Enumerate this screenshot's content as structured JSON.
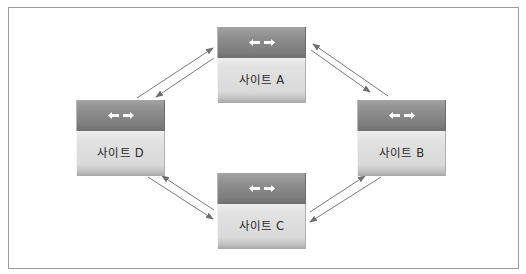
{
  "diagram": {
    "type": "replication-topology",
    "layout": "diamond",
    "colors": {
      "frame_border": "#9a9a9a",
      "header_fill": "#8e8e8e",
      "body_fill": "#e0e0e0",
      "arrow_stroke": "#6e6e6e",
      "label_text": "#2a2a2a",
      "icon_fill": "#ffffff"
    },
    "nodes": [
      {
        "id": "A",
        "label": "사이트 A",
        "position": "top",
        "icon": "bidirectional-arrows-icon"
      },
      {
        "id": "B",
        "label": "사이트 B",
        "position": "right",
        "icon": "bidirectional-arrows-icon"
      },
      {
        "id": "C",
        "label": "사이트 C",
        "position": "bottom",
        "icon": "bidirectional-arrows-icon"
      },
      {
        "id": "D",
        "label": "사이트 D",
        "position": "left",
        "icon": "bidirectional-arrows-icon"
      }
    ],
    "edges": [
      {
        "from": "D",
        "to": "A",
        "bidirectional": true
      },
      {
        "from": "A",
        "to": "B",
        "bidirectional": true
      },
      {
        "from": "B",
        "to": "C",
        "bidirectional": true
      },
      {
        "from": "C",
        "to": "D",
        "bidirectional": true
      }
    ]
  }
}
